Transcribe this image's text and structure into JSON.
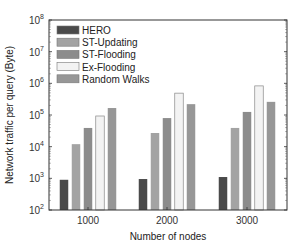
{
  "chart_data": {
    "type": "bar",
    "title": "",
    "xlabel": "Number of nodes",
    "ylabel": "Network traffic per query (Byte)",
    "yscale": "log",
    "ylim": [
      100,
      100000000
    ],
    "yticks": [
      100,
      1000,
      10000,
      100000,
      1000000,
      10000000,
      100000000
    ],
    "ytick_labels": [
      {
        "base": "10",
        "exp": "2"
      },
      {
        "base": "10",
        "exp": "3"
      },
      {
        "base": "10",
        "exp": "4"
      },
      {
        "base": "10",
        "exp": "5"
      },
      {
        "base": "10",
        "exp": "6"
      },
      {
        "base": "10",
        "exp": "7"
      },
      {
        "base": "10",
        "exp": "8"
      }
    ],
    "categories": [
      "1000",
      "2000",
      "3000"
    ],
    "series": [
      {
        "name": "HERO",
        "color": "#4a4a4a",
        "values": [
          900,
          950,
          1100
        ]
      },
      {
        "name": "ST-Updating",
        "color": "#a3a3a3",
        "values": [
          12000,
          27000,
          39000
        ]
      },
      {
        "name": "ST-Flooding",
        "color": "#8c8c8c",
        "values": [
          39000,
          80000,
          125000
        ]
      },
      {
        "name": "Ex-Flooding",
        "color": "#f3f3f3",
        "values": [
          93000,
          490000,
          830000
        ]
      },
      {
        "name": "Random Walks",
        "color": "#979797",
        "values": [
          166000,
          220000,
          260000
        ]
      }
    ],
    "legend_position": "upper left",
    "grid": false
  }
}
